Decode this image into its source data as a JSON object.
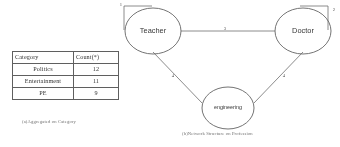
{
  "figure": {
    "panel_a": {
      "caption": "(a)Aggregated on Category",
      "table": {
        "headers": [
          "Category",
          "Count(*)"
        ],
        "rows": [
          {
            "category": "Politics",
            "count": "12"
          },
          {
            "category": "Entertainment",
            "count": "11"
          },
          {
            "category": "PE",
            "count": "9"
          }
        ]
      }
    },
    "panel_b": {
      "caption": "(b)Network Structure on Profession",
      "graph": {
        "nodes": [
          {
            "id": "teacher",
            "label": "Teacher"
          },
          {
            "id": "doctor",
            "label": "Doctor"
          },
          {
            "id": "engineering",
            "label": "engineering"
          }
        ],
        "self_loops": [
          {
            "node": "teacher",
            "label": "1"
          },
          {
            "node": "doctor",
            "label": "2"
          }
        ],
        "edges": [
          {
            "source": "teacher",
            "target": "doctor",
            "label": "3"
          },
          {
            "source": "teacher",
            "target": "engineering",
            "label": "4"
          },
          {
            "source": "doctor",
            "target": "engineering",
            "label": "4"
          }
        ]
      }
    }
  },
  "colors": {
    "stroke": "#6a6a6a",
    "text": "#2f2f2f",
    "table_border": "#5a5a5a",
    "caption": "#6d6d6d"
  }
}
